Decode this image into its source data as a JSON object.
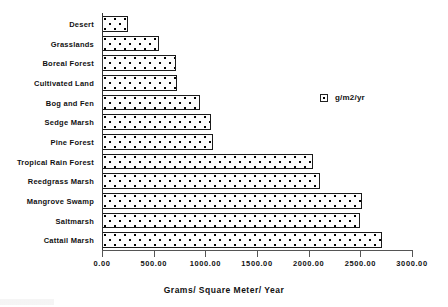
{
  "chart_data": {
    "type": "bar",
    "orientation": "horizontal",
    "title": "",
    "xlabel": "Grams/ Square Meter/ Year",
    "ylabel": "",
    "xlim": [
      0,
      3000
    ],
    "xticks": [
      "0.00",
      "500.00",
      "1000.00",
      "1500.00",
      "2000.00",
      "2500.00",
      "3000.00"
    ],
    "xtick_values": [
      0,
      500,
      1000,
      1500,
      2000,
      2500,
      3000
    ],
    "grid": false,
    "legend": {
      "position": "upper-right-inside",
      "entries": [
        {
          "label": "g/m2/yr",
          "marker": "dotted-square-swatch"
        }
      ]
    },
    "categories": [
      "Desert",
      "Grasslands",
      "Boreal Forest",
      "Cultivated Land",
      "Bog and Fen",
      "Sedge Marsh",
      "Pine Forest",
      "Tropical Rain Forest",
      "Reedgrass Marsh",
      "Mangrove Swamp",
      "Saltmarsh",
      "Cattail Marsh"
    ],
    "series": [
      {
        "name": "g/m2/yr",
        "values": [
          250,
          550,
          715,
          725,
          950,
          1055,
          1075,
          2040,
          2110,
          2515,
          2495,
          2710
        ]
      }
    ]
  },
  "colors": {
    "bar_fill": "#fdfdfd",
    "bar_edge": "#1a1a1a",
    "axis": "#555555",
    "text": "#111111",
    "background": "#ffffff"
  }
}
